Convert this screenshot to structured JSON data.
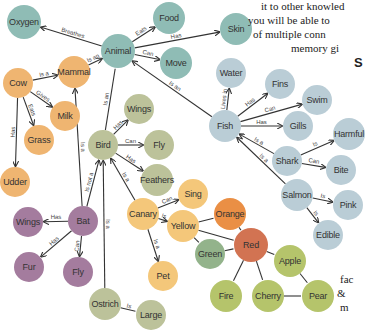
{
  "colors": {
    "teal": "#8fbcb5",
    "orange": "#efb571",
    "sage": "#bcc29a",
    "blue": "#bacdd6",
    "purple": "#a47c9e",
    "yellow": "#f4c77a",
    "deep_orange": "#ea8f45",
    "red": "#d27352",
    "green": "#93b38b",
    "lime": "#b5c46b",
    "edge": "#333333"
  },
  "nodes": [
    {
      "id": "oxygen",
      "label": "Oxygen",
      "x": 24,
      "y": 22,
      "r": 17,
      "color": "teal"
    },
    {
      "id": "animal",
      "label": "Animal",
      "x": 118,
      "y": 51,
      "r": 17,
      "color": "teal"
    },
    {
      "id": "food",
      "label": "Food",
      "x": 169,
      "y": 18,
      "r": 16,
      "color": "teal"
    },
    {
      "id": "skin",
      "label": "Skin",
      "x": 236,
      "y": 29,
      "r": 16,
      "color": "teal"
    },
    {
      "id": "move",
      "label": "Move",
      "x": 176,
      "y": 63,
      "r": 16,
      "color": "teal"
    },
    {
      "id": "mammal",
      "label": "Mammal",
      "x": 74,
      "y": 72,
      "r": 16,
      "color": "orange"
    },
    {
      "id": "cow",
      "label": "Cow",
      "x": 18,
      "y": 83,
      "r": 15,
      "color": "orange"
    },
    {
      "id": "milk",
      "label": "Milk",
      "x": 65,
      "y": 116,
      "r": 15,
      "color": "orange"
    },
    {
      "id": "grass",
      "label": "Grass",
      "x": 39,
      "y": 140,
      "r": 15,
      "color": "orange"
    },
    {
      "id": "udder",
      "label": "Udder",
      "x": 15,
      "y": 182,
      "r": 15,
      "color": "orange"
    },
    {
      "id": "wings_bird",
      "label": "Wings",
      "x": 139,
      "y": 109,
      "r": 15,
      "color": "sage"
    },
    {
      "id": "bird",
      "label": "Bird",
      "x": 103,
      "y": 145,
      "r": 15,
      "color": "sage"
    },
    {
      "id": "fly_bird",
      "label": "Fly",
      "x": 159,
      "y": 145,
      "r": 15,
      "color": "sage"
    },
    {
      "id": "feathers",
      "label": "Feathers",
      "x": 157,
      "y": 180,
      "r": 16,
      "color": "sage"
    },
    {
      "id": "water",
      "label": "Water",
      "x": 231,
      "y": 73,
      "r": 15,
      "color": "blue"
    },
    {
      "id": "fins",
      "label": "Fins",
      "x": 280,
      "y": 84,
      "r": 15,
      "color": "blue"
    },
    {
      "id": "swim",
      "label": "Swim",
      "x": 317,
      "y": 100,
      "r": 15,
      "color": "blue"
    },
    {
      "id": "fish",
      "label": "Fish",
      "x": 225,
      "y": 126,
      "r": 16,
      "color": "blue"
    },
    {
      "id": "gills",
      "label": "Gills",
      "x": 298,
      "y": 126,
      "r": 15,
      "color": "blue"
    },
    {
      "id": "harmful",
      "label": "Harmful",
      "x": 349,
      "y": 134,
      "r": 16,
      "color": "blue"
    },
    {
      "id": "shark",
      "label": "Shark",
      "x": 287,
      "y": 161,
      "r": 15,
      "color": "blue"
    },
    {
      "id": "bite",
      "label": "Bite",
      "x": 341,
      "y": 170,
      "r": 15,
      "color": "blue"
    },
    {
      "id": "salmon",
      "label": "Salmon",
      "x": 297,
      "y": 195,
      "r": 16,
      "color": "blue"
    },
    {
      "id": "pink",
      "label": "Pink",
      "x": 348,
      "y": 205,
      "r": 15,
      "color": "blue"
    },
    {
      "id": "edible",
      "label": "Edible",
      "x": 328,
      "y": 235,
      "r": 15,
      "color": "blue"
    },
    {
      "id": "wings_bat",
      "label": "Wings",
      "x": 28,
      "y": 222,
      "r": 15,
      "color": "purple"
    },
    {
      "id": "bat",
      "label": "Bat",
      "x": 83,
      "y": 221,
      "r": 15,
      "color": "purple"
    },
    {
      "id": "fur",
      "label": "Fur",
      "x": 29,
      "y": 267,
      "r": 15,
      "color": "purple"
    },
    {
      "id": "fly_bat",
      "label": "Fly",
      "x": 78,
      "y": 272,
      "r": 15,
      "color": "purple"
    },
    {
      "id": "sing",
      "label": "Sing",
      "x": 193,
      "y": 194,
      "r": 15,
      "color": "yellow"
    },
    {
      "id": "canary",
      "label": "Canary",
      "x": 143,
      "y": 214,
      "r": 16,
      "color": "yellow"
    },
    {
      "id": "yellow",
      "label": "Yellow",
      "x": 183,
      "y": 226,
      "r": 16,
      "color": "yellow"
    },
    {
      "id": "orange",
      "label": "Orange",
      "x": 230,
      "y": 214,
      "r": 16,
      "color": "deep_orange"
    },
    {
      "id": "pet",
      "label": "Pet",
      "x": 163,
      "y": 276,
      "r": 15,
      "color": "yellow"
    },
    {
      "id": "green",
      "label": "Green",
      "x": 210,
      "y": 254,
      "r": 15,
      "color": "green"
    },
    {
      "id": "red",
      "label": "Red",
      "x": 251,
      "y": 245,
      "r": 17,
      "color": "red"
    },
    {
      "id": "apple",
      "label": "Apple",
      "x": 290,
      "y": 261,
      "r": 16,
      "color": "lime"
    },
    {
      "id": "fire",
      "label": "Fire",
      "x": 226,
      "y": 296,
      "r": 16,
      "color": "lime"
    },
    {
      "id": "cherry",
      "label": "Cherry",
      "x": 268,
      "y": 296,
      "r": 16,
      "color": "lime"
    },
    {
      "id": "pear",
      "label": "Pear",
      "x": 318,
      "y": 296,
      "r": 16,
      "color": "lime"
    },
    {
      "id": "ostrich",
      "label": "Ostrich",
      "x": 105,
      "y": 304,
      "r": 16,
      "color": "sage"
    },
    {
      "id": "large",
      "label": "Large",
      "x": 151,
      "y": 315,
      "r": 15,
      "color": "sage"
    }
  ],
  "edges": [
    {
      "from": "animal",
      "to": "oxygen",
      "label": "Breathes",
      "arrow": true
    },
    {
      "from": "animal",
      "to": "food",
      "label": "Eats",
      "arrow": true
    },
    {
      "from": "animal",
      "to": "skin",
      "label": "Has",
      "arrow": true
    },
    {
      "from": "animal",
      "to": "move",
      "label": "Can",
      "arrow": true
    },
    {
      "from": "mammal",
      "to": "animal",
      "label": "Is an",
      "arrow": true
    },
    {
      "from": "bird",
      "to": "animal",
      "label": "Is an",
      "arrow": false
    },
    {
      "from": "fish",
      "to": "animal",
      "label": "Is an",
      "arrow": true
    },
    {
      "from": "cow",
      "to": "mammal",
      "label": "Is a",
      "arrow": true
    },
    {
      "from": "cow",
      "to": "milk",
      "label": "Gives",
      "arrow": true
    },
    {
      "from": "cow",
      "to": "grass",
      "label": "Eats",
      "arrow": true
    },
    {
      "from": "cow",
      "to": "udder",
      "label": "Has",
      "arrow": true
    },
    {
      "from": "bat",
      "to": "mammal",
      "label": "Is a",
      "arrow": true
    },
    {
      "from": "bat",
      "to": "bird",
      "label": "Is not a",
      "arrow": true
    },
    {
      "from": "bat",
      "to": "wings_bat",
      "label": "Has",
      "arrow": true
    },
    {
      "from": "bat",
      "to": "fur",
      "label": "Has",
      "arrow": true
    },
    {
      "from": "bat",
      "to": "fly_bat",
      "label": "Can",
      "arrow": true
    },
    {
      "from": "bird",
      "to": "wings_bird",
      "label": "Has",
      "arrow": true
    },
    {
      "from": "bird",
      "to": "fly_bird",
      "label": "Can",
      "arrow": true
    },
    {
      "from": "bird",
      "to": "feathers",
      "label": "Has",
      "arrow": true
    },
    {
      "from": "canary",
      "to": "bird",
      "label": "Is a",
      "arrow": true
    },
    {
      "from": "ostrich",
      "to": "bird",
      "label": "Is a",
      "arrow": true
    },
    {
      "from": "ostrich",
      "to": "large",
      "label": "Is",
      "arrow": false
    },
    {
      "from": "canary",
      "to": "sing",
      "label": "Can",
      "arrow": true
    },
    {
      "from": "canary",
      "to": "yellow",
      "label": "Is",
      "arrow": true
    },
    {
      "from": "canary",
      "to": "pet",
      "label": "Is a",
      "arrow": true
    },
    {
      "from": "fish",
      "to": "water",
      "label": "Lives in",
      "arrow": true
    },
    {
      "from": "fish",
      "to": "fins",
      "label": "Has",
      "arrow": true
    },
    {
      "from": "fish",
      "to": "swim",
      "label": "Can",
      "arrow": true
    },
    {
      "from": "fish",
      "to": "gills",
      "label": "Has",
      "arrow": true
    },
    {
      "from": "shark",
      "to": "fish",
      "label": "Is a",
      "arrow": true
    },
    {
      "from": "salmon",
      "to": "fish",
      "label": "Is a",
      "arrow": true
    },
    {
      "from": "shark",
      "to": "harmful",
      "label": "Is",
      "arrow": true
    },
    {
      "from": "shark",
      "to": "bite",
      "label": "Can",
      "arrow": true
    },
    {
      "from": "salmon",
      "to": "pink",
      "label": "Is",
      "arrow": true
    },
    {
      "from": "salmon",
      "to": "edible",
      "label": "Is",
      "arrow": true
    },
    {
      "from": "yellow",
      "to": "orange",
      "label": "",
      "arrow": false
    },
    {
      "from": "yellow",
      "to": "green",
      "label": "",
      "arrow": false
    },
    {
      "from": "yellow",
      "to": "red",
      "label": "",
      "arrow": false
    },
    {
      "from": "orange",
      "to": "red",
      "label": "",
      "arrow": false
    },
    {
      "from": "green",
      "to": "red",
      "label": "",
      "arrow": false
    },
    {
      "from": "red",
      "to": "apple",
      "label": "",
      "arrow": false
    },
    {
      "from": "red",
      "to": "fire",
      "label": "",
      "arrow": false
    },
    {
      "from": "red",
      "to": "cherry",
      "label": "",
      "arrow": false
    },
    {
      "from": "apple",
      "to": "pear",
      "label": "",
      "arrow": false
    },
    {
      "from": "cherry",
      "to": "pear",
      "label": "",
      "arrow": false
    }
  ],
  "side_text": {
    "lines": [
      {
        "text": "it to other knowled",
        "x": 261,
        "y": 0,
        "size": 11
      },
      {
        "text": "you will be able to",
        "x": 248,
        "y": 14,
        "size": 11
      },
      {
        "text": "of multiple conn",
        "x": 253,
        "y": 28,
        "size": 11
      },
      {
        "text": "memory gi",
        "x": 291,
        "y": 42,
        "size": 11
      },
      {
        "text": "fac",
        "x": 340,
        "y": 273,
        "size": 11
      },
      {
        "text": "&",
        "x": 337,
        "y": 287,
        "size": 11
      },
      {
        "text": "m",
        "x": 340,
        "y": 301,
        "size": 11
      }
    ],
    "heading": {
      "text": "S",
      "x": 354,
      "y": 55,
      "size": 13
    }
  }
}
